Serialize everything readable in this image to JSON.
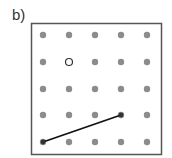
{
  "figure": {
    "label": "b)",
    "grid": {
      "rows": 5,
      "cols": 5,
      "x": [
        43,
        69,
        95,
        121,
        147
      ],
      "y": [
        35,
        62,
        89,
        115,
        142
      ],
      "dot_color": "#8c8c8c",
      "open_point": {
        "row": 1,
        "col": 1
      },
      "segment": {
        "from": {
          "row": 4,
          "col": 0
        },
        "to": {
          "row": 3,
          "col": 3
        }
      }
    },
    "frame_color": "#555555",
    "line_color": "#111111"
  }
}
